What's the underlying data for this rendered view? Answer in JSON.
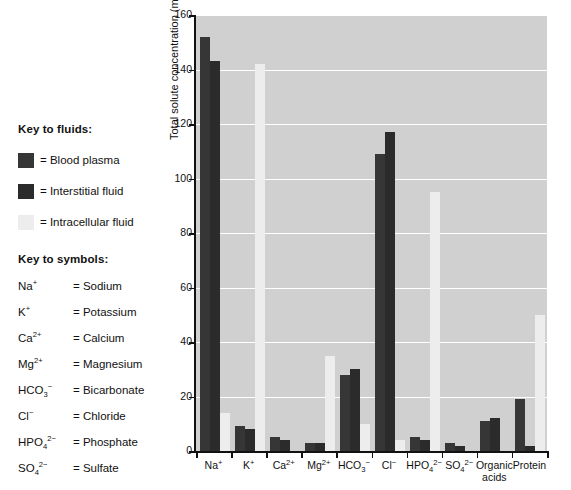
{
  "key_fluids": {
    "title": "Key to fluids:",
    "items": [
      {
        "label": "= Blood plasma",
        "color": "#363636",
        "series": "plasma"
      },
      {
        "label": "= Interstitial fluid",
        "color": "#2b2b2b",
        "series": "interstitial"
      },
      {
        "label": "= Intracellular fluid",
        "color": "#ededed",
        "series": "intracellular"
      }
    ]
  },
  "key_symbols": {
    "title": "Key to symbols:",
    "items": [
      {
        "formula_html": "Na<sup>+</sup>",
        "meaning": "= Sodium"
      },
      {
        "formula_html": "K<sup>+</sup>",
        "meaning": "= Potassium"
      },
      {
        "formula_html": "Ca<sup>2+</sup>",
        "meaning": "= Calcium"
      },
      {
        "formula_html": "Mg<sup>2+</sup>",
        "meaning": "= Magnesium"
      },
      {
        "formula_html": "HCO<sub>3</sub><sup>−</sup>",
        "meaning": "= Bicarbonate"
      },
      {
        "formula_html": "Cl<sup>−</sup>",
        "meaning": "= Chloride"
      },
      {
        "formula_html": "HPO<sub>4</sub><sup>2−</sup>",
        "meaning": "= Phosphate"
      },
      {
        "formula_html": "SO<sub>4</sub><sup>2−</sup>",
        "meaning": "= Sulfate"
      }
    ]
  },
  "chart_data": {
    "type": "bar",
    "title": "",
    "xlabel": "",
    "ylabel": "Total solute concentration (mEq/L)",
    "ylim": [
      0,
      160
    ],
    "yticks": [
      0,
      20,
      40,
      60,
      80,
      100,
      120,
      140,
      160
    ],
    "grid": true,
    "legend_position": "left-panel",
    "categories": [
      "Na+",
      "K+",
      "Ca2+",
      "Mg2+",
      "HCO3-",
      "Cl-",
      "HPO4 2-",
      "SO4 2-",
      "Organic acids",
      "Protein"
    ],
    "categories_html": [
      "Na<sup>+</sup>",
      "K<sup>+</sup>",
      "Ca<sup>2+</sup>",
      "Mg<sup>2+</sup>",
      "HCO<sub>3</sub><sup>−</sup>",
      "Cl<sup>−</sup>",
      "HPO<sub>4</sub><sup>2−</sup>",
      "SO<sub>4</sub><sup>2−</sup>",
      "Organic|acids",
      "Protein"
    ],
    "series": [
      {
        "name": "Blood plasma",
        "color": "#363636",
        "values": [
          152,
          9,
          5,
          3,
          28,
          109,
          5,
          3,
          11,
          19
        ]
      },
      {
        "name": "Interstitial fluid",
        "color": "#2b2b2b",
        "values": [
          143,
          8,
          4,
          3,
          30,
          117,
          4,
          2,
          12,
          2
        ]
      },
      {
        "name": "Intracellular fluid",
        "color": "#ededed",
        "values": [
          14,
          142,
          0,
          35,
          10,
          4,
          95,
          0,
          0,
          50
        ]
      }
    ],
    "plot_background": "#d0d0d0",
    "gridline_color": "#ffffff",
    "axis_color": "#111111"
  }
}
